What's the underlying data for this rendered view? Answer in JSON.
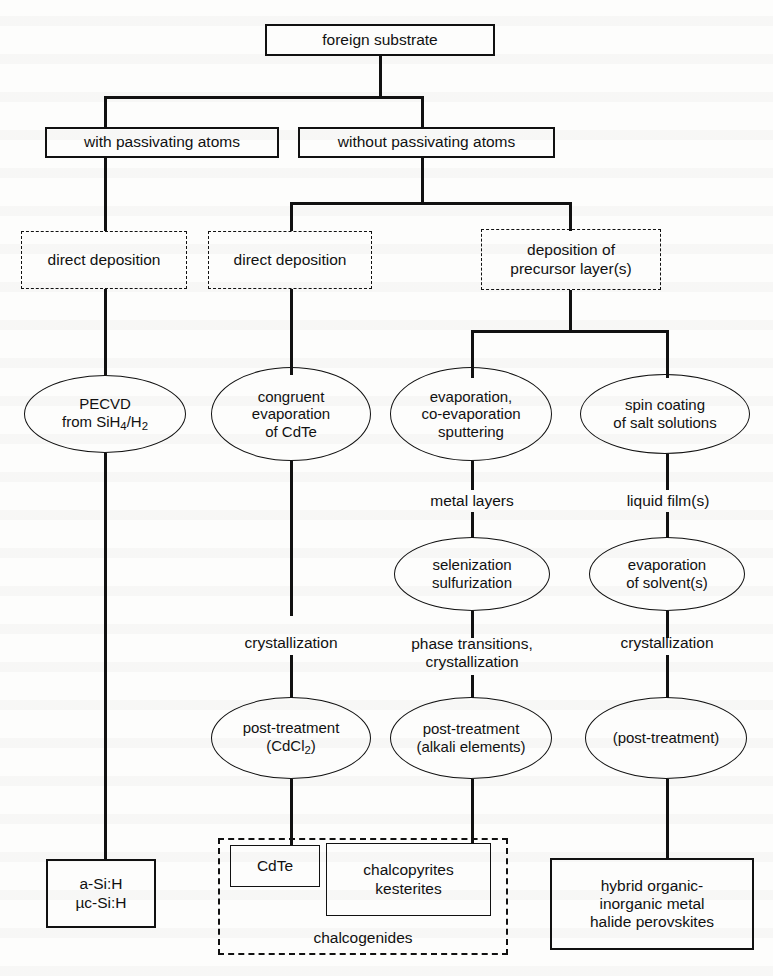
{
  "diagram": {
    "type": "flowchart",
    "colors": {
      "stroke": "#111111",
      "background": "#fdfdfc"
    },
    "nodes": {
      "root": {
        "label": "foreign substrate",
        "shape": "box"
      },
      "with_passivating": {
        "label": "with  passivating atoms",
        "shape": "box"
      },
      "without_passivating": {
        "label": "without  passivating atoms",
        "shape": "box"
      },
      "direct_deposition_left": {
        "label": "direct deposition",
        "shape": "dashed-box"
      },
      "direct_deposition_mid": {
        "label": "direct deposition",
        "shape": "dashed-box"
      },
      "deposition_precursor": {
        "label_line1": "deposition of",
        "label_line2": "precursor layer(s)",
        "shape": "dashed-box"
      },
      "pecvd": {
        "label_line1": "PECVD",
        "label_line2_a": "from SiH",
        "label_line2_sub": "4",
        "label_line2_b": "/H",
        "label_line2_sub2": "2",
        "shape": "ellipse"
      },
      "congruent_evaporation": {
        "label_line1": "congruent",
        "label_line2": "evaporation",
        "label_line3": "of CdTe",
        "shape": "ellipse"
      },
      "evaporation_sputtering": {
        "label_line1": "evaporation,",
        "label_line2": "co-evaporation",
        "label_line3": "sputtering",
        "shape": "ellipse"
      },
      "spin_coating": {
        "label_line1": "spin coating",
        "label_line2": "of salt solutions",
        "shape": "ellipse"
      },
      "metal_layers": {
        "label": "metal layers",
        "shape": "text"
      },
      "liquid_films": {
        "label": "liquid film(s)",
        "shape": "text"
      },
      "selenization": {
        "label_line1": "selenization",
        "label_line2": "sulfurization",
        "shape": "ellipse"
      },
      "evaporation_solvents": {
        "label_line1": "evaporation",
        "label_line2": "of solvent(s)",
        "shape": "ellipse"
      },
      "crystallization_left": {
        "label": "crystallization",
        "shape": "text"
      },
      "phase_transitions": {
        "label_line1": "phase transitions,",
        "label_line2": "crystallization",
        "shape": "text"
      },
      "crystallization_right": {
        "label": "crystallization",
        "shape": "text"
      },
      "post_treatment_cdcl2": {
        "label_line1": "post-treatment",
        "label_line2_a": "(CdCl",
        "label_line2_sub": "2",
        "label_line2_b": ")",
        "shape": "ellipse"
      },
      "post_treatment_alkali": {
        "label_line1": "post-treatment",
        "label_line2": "(alkali elements)",
        "shape": "ellipse"
      },
      "post_treatment_optional": {
        "label": "(post-treatment)",
        "shape": "ellipse"
      },
      "a_si_h": {
        "label_line1": "a-Si:H",
        "label_line2": "µc-Si:H",
        "shape": "box"
      },
      "cdte": {
        "label": "CdTe",
        "shape": "box"
      },
      "chalcopyrites": {
        "label_line1": "chalcopyrites",
        "label_line2": "kesterites",
        "shape": "box"
      },
      "chalcogenides_group": {
        "label": "chalcogenides",
        "shape": "dashed-box"
      },
      "perovskites": {
        "label_line1": "hybrid organic-",
        "label_line2": "inorganic metal",
        "label_line3": "halide perovskites",
        "shape": "box"
      }
    }
  }
}
